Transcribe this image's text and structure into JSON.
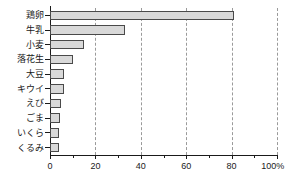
{
  "chart_data": {
    "type": "bar",
    "orientation": "horizontal",
    "title": "",
    "subtitle": "",
    "xlabel": "",
    "ylabel": "",
    "categories": [
      "鶏卵",
      "牛乳",
      "小麦",
      "落花生",
      "大豆",
      "キウイ",
      "えび",
      "ごま",
      "いくら",
      "くるみ"
    ],
    "values": [
      81,
      33,
      15,
      10,
      6,
      6,
      5,
      4.5,
      4,
      4
    ],
    "xlim": [
      0,
      100
    ],
    "ylim": null,
    "xticks": [
      0,
      20,
      40,
      60,
      80,
      100
    ],
    "xtick_labels": [
      "0",
      "20",
      "40",
      "60",
      "80",
      "100%"
    ],
    "minor_xticks": [
      10,
      30,
      50,
      70,
      90
    ],
    "unit": "%",
    "grid": "vertical-dashed",
    "legend": null,
    "legend_position": "none",
    "series": [
      {
        "name": "",
        "values": [
          81,
          33,
          15,
          10,
          6,
          6,
          5,
          4.5,
          4,
          4
        ]
      }
    ],
    "colors": {
      "bar_fill": "#d9d9d9",
      "bar_border": "#4a4a4a",
      "axis": "#1a1a1a",
      "gridline": "#9a9a9a",
      "text": "#1a1a1a",
      "background": "#ffffff"
    }
  }
}
